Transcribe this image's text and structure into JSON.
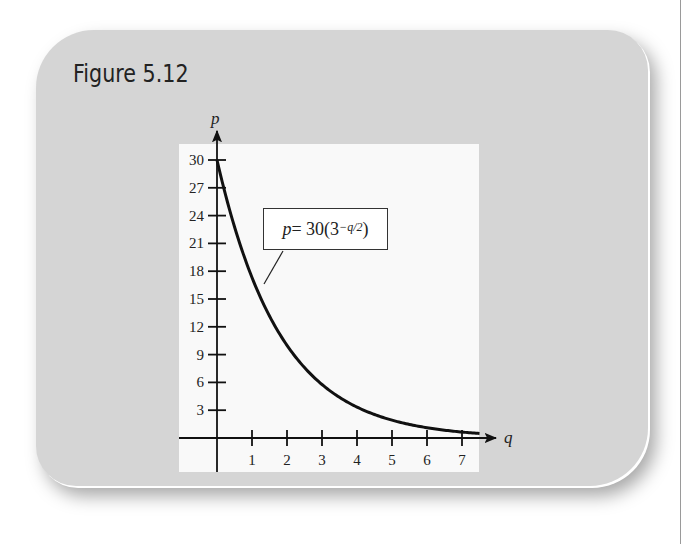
{
  "figure": {
    "title": "Figure 5.12"
  },
  "equation": {
    "lhs": "p",
    "equals": " = 30(3",
    "exponent": "−q/2",
    "close": ")"
  },
  "chart_data": {
    "type": "line",
    "title": "Figure 5.12",
    "xlabel": "q",
    "ylabel": "p",
    "xlim": [
      0,
      7.5
    ],
    "ylim": [
      0,
      30
    ],
    "x_ticks": [
      1,
      2,
      3,
      4,
      5,
      6,
      7
    ],
    "y_ticks": [
      3,
      6,
      9,
      12,
      15,
      18,
      21,
      24,
      27,
      30
    ],
    "grid": false,
    "legend": null,
    "annotations": [
      "p = 30(3^(−q/2))"
    ],
    "series": [
      {
        "name": "p = 30(3^(-q/2))",
        "x": [
          0,
          0.5,
          1,
          1.5,
          2,
          2.5,
          3,
          3.5,
          4,
          4.5,
          5,
          5.5,
          6,
          6.5,
          7,
          7.5
        ],
        "values": [
          30,
          22.79,
          17.32,
          13.16,
          10,
          7.6,
          5.77,
          4.39,
          3.33,
          2.53,
          1.92,
          1.46,
          1.11,
          0.84,
          0.64,
          0.49
        ]
      }
    ]
  }
}
